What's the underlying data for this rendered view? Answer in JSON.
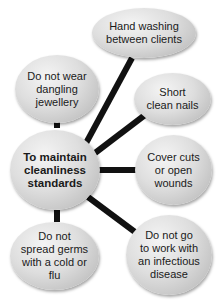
{
  "diagram": {
    "type": "spider-diagram",
    "center": {
      "label": "To maintain\ncleanliness\nstandards"
    },
    "branches": [
      {
        "label": "Hand washing\nbetween clients"
      },
      {
        "label": "Do not wear\ndangling\njewellery"
      },
      {
        "label": "Short\nclean nails"
      },
      {
        "label": "Cover cuts\nor open\nwounds"
      },
      {
        "label": "Do not\nspread germs\nwith a cold or\nflu"
      },
      {
        "label": "Do not go\nto work with\nan infectious\ndisease"
      }
    ],
    "colors": {
      "connector": "#111111",
      "bubble": "#d8d8d8",
      "text": "#1a1a1a"
    }
  }
}
